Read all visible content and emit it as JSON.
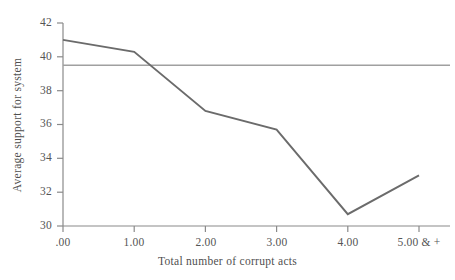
{
  "chart_data": {
    "type": "line",
    "title": "",
    "subtitle": "",
    "xlabel": "Total number of corrupt acts",
    "ylabel": "Average support for system",
    "categories": [
      ".00",
      "1.00",
      "2.00",
      "3.00",
      "4.00",
      "5.00 & +"
    ],
    "x": [
      0,
      1,
      2,
      3,
      4,
      5
    ],
    "series": [
      {
        "name": "Average support for system",
        "values": [
          41.0,
          40.3,
          36.8,
          35.7,
          30.7,
          33.0
        ],
        "color": "#6b6b6b"
      }
    ],
    "reference_line": {
      "name": "Overall mean",
      "value": 39.5,
      "orientation": "horizontal",
      "color": "#a0a0a0"
    },
    "xlim": [
      0,
      5
    ],
    "ylim": [
      30,
      42
    ],
    "yticks": [
      42,
      40,
      38,
      36,
      34,
      32,
      30
    ],
    "ytick_labels": [
      "42",
      "40",
      "38",
      "36",
      "34",
      "32",
      "30"
    ],
    "xticks": [
      0,
      1,
      2,
      3,
      4,
      5
    ],
    "xtick_labels": [
      ".00",
      "1.00",
      "2.00",
      "3.00",
      "4.00",
      "5.00 & +"
    ],
    "grid": false,
    "legend": "none",
    "axis_color": "#888888"
  },
  "axis_titles": {
    "x": "Total number of corrupt acts",
    "y": "Average support for system"
  },
  "y_labels": {
    "t0": "42",
    "t1": "40",
    "t2": "38",
    "t3": "36",
    "t4": "34",
    "t5": "32",
    "t6": "30"
  },
  "x_labels": {
    "t0": ".00",
    "t1": "1.00",
    "t2": "2.00",
    "t3": "3.00",
    "t4": "4.00",
    "t5": "5.00 & +"
  }
}
